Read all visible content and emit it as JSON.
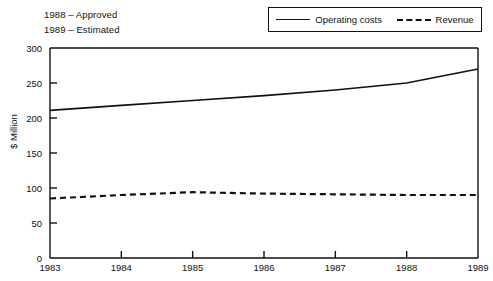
{
  "annotations": [
    {
      "text": "1988 – Approved"
    },
    {
      "text": "1989 – Estimated"
    }
  ],
  "legend": {
    "entries": [
      {
        "label": "Operating costs",
        "style": "solid"
      },
      {
        "label": "Revenue",
        "style": "dashed"
      }
    ]
  },
  "chart_data": {
    "type": "line",
    "title": "",
    "xlabel": "",
    "ylabel": "$ Million",
    "x": [
      1983,
      1984,
      1985,
      1986,
      1987,
      1988,
      1989
    ],
    "categories": [
      "1983",
      "1984",
      "1985",
      "1986",
      "1987",
      "1988",
      "1989"
    ],
    "xlim": [
      1983,
      1989
    ],
    "ylim": [
      0,
      300
    ],
    "yticks": [
      0,
      50,
      100,
      150,
      200,
      250,
      300
    ],
    "ytick_labels": [
      "0",
      "50",
      "100",
      "150",
      "200",
      "250",
      "300"
    ],
    "xticks": [
      1983,
      1984,
      1985,
      1986,
      1987,
      1988,
      1989
    ],
    "xtick_labels": [
      "1983",
      "1984",
      "1985",
      "1986",
      "1987",
      "1988",
      "1989"
    ],
    "grid": false,
    "legend_position": "top-right",
    "series": [
      {
        "name": "Operating costs",
        "style": "solid",
        "color": "#111111",
        "values": [
          211,
          218,
          225,
          232,
          240,
          250,
          270
        ]
      },
      {
        "name": "Revenue",
        "style": "dashed",
        "color": "#111111",
        "values": [
          85,
          90,
          94,
          92,
          91,
          90,
          90
        ]
      }
    ]
  },
  "colors": {
    "axis": "#111111",
    "line": "#111111",
    "background": "#ffffff"
  }
}
